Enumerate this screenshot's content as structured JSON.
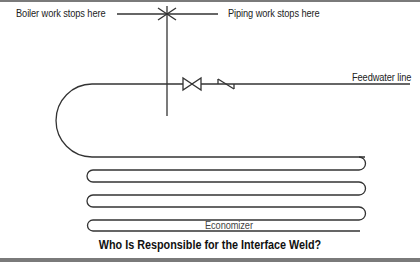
{
  "diagram": {
    "caption": "Who Is Responsible for the Interface Weld?",
    "labels": {
      "boiler": "Boiler work stops here",
      "piping": "Piping work stops here",
      "feedwater": "Feedwater line",
      "economizer": "Economizer"
    },
    "symbols": {
      "weld": "weld-point-asterisk",
      "gate_valve": "gate-valve",
      "check_valve": "check-valve"
    },
    "colors": {
      "line": "#333333",
      "frame": "#7a7a7a",
      "text": "#222222"
    }
  }
}
